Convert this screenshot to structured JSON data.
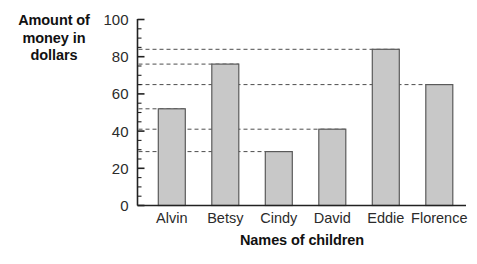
{
  "chart_data": {
    "type": "bar",
    "title": "",
    "categories": [
      "Alvin",
      "Betsy",
      "Cindy",
      "David",
      "Eddie",
      "Florence"
    ],
    "values": [
      52,
      76,
      29,
      41,
      84,
      65
    ],
    "series": [
      {
        "name": "Amount of money in dollars",
        "values": [
          52,
          76,
          29,
          41,
          84,
          65
        ]
      }
    ],
    "xlabel": "Names of children",
    "ylabel": "Amount of money in dollars",
    "ylabel_lines": [
      "Amount of",
      "money in",
      "dollars"
    ],
    "ylim": [
      0,
      100
    ],
    "yticks": [
      0,
      20,
      40,
      60,
      80,
      100
    ],
    "ytick_labels": [
      "0",
      "20",
      "40",
      "60",
      "80",
      "100"
    ],
    "yminor_step": 5,
    "grid": "dashed guide line from y-axis to top of each bar",
    "legend": "none",
    "legend_position": "none",
    "colors": {
      "bar_fill": "#c8c8c8",
      "bar_stroke": "#5a5a5a",
      "axis": "#222222",
      "grid": "#4d4d4d",
      "text": "#1a1a1a",
      "background": "#ffffff"
    }
  }
}
